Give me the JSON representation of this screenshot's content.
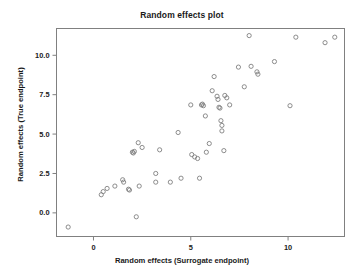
{
  "chart_data": {
    "type": "scatter",
    "title": "Random effects plot",
    "xlabel": "Random effects (Surrogate endpoint)",
    "ylabel": "Random effects (True endpoint)",
    "xlim": [
      -1.9,
      12.9
    ],
    "ylim": [
      -1.5,
      11.7
    ],
    "xticks": [
      0,
      5,
      10
    ],
    "xtick_labels": [
      "0",
      "5",
      "10"
    ],
    "yticks": [
      0.0,
      2.5,
      5.0,
      7.5,
      10.0
    ],
    "ytick_labels": [
      "0.0",
      "2.5",
      "5.0",
      "7.5",
      "10.0"
    ],
    "grid": false,
    "legend": null,
    "marker": "open-circle",
    "marker_color": "#808080",
    "frame_color": "#808080",
    "points": [
      {
        "x": -1.3,
        "y": -0.9
      },
      {
        "x": 0.4,
        "y": 1.15
      },
      {
        "x": 0.5,
        "y": 1.35
      },
      {
        "x": 0.7,
        "y": 1.55
      },
      {
        "x": 1.1,
        "y": 1.7
      },
      {
        "x": 1.5,
        "y": 2.1
      },
      {
        "x": 1.55,
        "y": 1.95
      },
      {
        "x": 1.8,
        "y": 1.5
      },
      {
        "x": 1.85,
        "y": 1.45
      },
      {
        "x": 2.0,
        "y": 3.85
      },
      {
        "x": 2.05,
        "y": 3.8
      },
      {
        "x": 2.1,
        "y": 3.9
      },
      {
        "x": 2.2,
        "y": -0.25
      },
      {
        "x": 2.3,
        "y": 4.45
      },
      {
        "x": 2.35,
        "y": 1.7
      },
      {
        "x": 2.5,
        "y": 4.15
      },
      {
        "x": 3.2,
        "y": 2.5
      },
      {
        "x": 3.2,
        "y": 1.95
      },
      {
        "x": 3.4,
        "y": 4.0
      },
      {
        "x": 3.95,
        "y": 1.95
      },
      {
        "x": 4.35,
        "y": 5.1
      },
      {
        "x": 4.5,
        "y": 2.2
      },
      {
        "x": 5.0,
        "y": 6.85
      },
      {
        "x": 5.05,
        "y": 3.7
      },
      {
        "x": 5.2,
        "y": 3.55
      },
      {
        "x": 5.35,
        "y": 3.45
      },
      {
        "x": 5.45,
        "y": 2.2
      },
      {
        "x": 5.55,
        "y": 6.85
      },
      {
        "x": 5.6,
        "y": 6.9
      },
      {
        "x": 5.65,
        "y": 6.8
      },
      {
        "x": 5.75,
        "y": 6.15
      },
      {
        "x": 5.8,
        "y": 3.85
      },
      {
        "x": 5.95,
        "y": 4.4
      },
      {
        "x": 6.1,
        "y": 7.75
      },
      {
        "x": 6.2,
        "y": 8.65
      },
      {
        "x": 6.35,
        "y": 7.4
      },
      {
        "x": 6.4,
        "y": 7.2
      },
      {
        "x": 6.45,
        "y": 6.7
      },
      {
        "x": 6.5,
        "y": 6.65
      },
      {
        "x": 6.55,
        "y": 5.85
      },
      {
        "x": 6.6,
        "y": 5.55
      },
      {
        "x": 6.6,
        "y": 5.2
      },
      {
        "x": 6.7,
        "y": 3.95
      },
      {
        "x": 6.75,
        "y": 7.45
      },
      {
        "x": 6.85,
        "y": 7.3
      },
      {
        "x": 7.0,
        "y": 6.85
      },
      {
        "x": 7.45,
        "y": 9.25
      },
      {
        "x": 7.75,
        "y": 8.0
      },
      {
        "x": 8.0,
        "y": 11.25
      },
      {
        "x": 8.1,
        "y": 9.3
      },
      {
        "x": 8.4,
        "y": 8.95
      },
      {
        "x": 8.45,
        "y": 8.8
      },
      {
        "x": 9.3,
        "y": 9.6
      },
      {
        "x": 10.1,
        "y": 6.8
      },
      {
        "x": 10.4,
        "y": 11.15
      },
      {
        "x": 11.9,
        "y": 10.8
      },
      {
        "x": 12.4,
        "y": 11.15
      }
    ]
  }
}
